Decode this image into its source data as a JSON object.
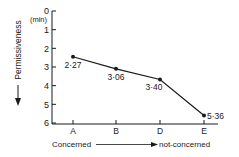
{
  "chart_data": {
    "type": "line",
    "title": "",
    "xlabel": "Concerned → not-concerned",
    "xlabel_left": "Concerned",
    "xlabel_right": "not-concerned",
    "ylabel": "Permissiveness",
    "y_unit": "(min)",
    "ylim": [
      0,
      6
    ],
    "y_inverted": true,
    "y_ticks": [
      "0",
      "1",
      "2",
      "3",
      "4",
      "5",
      "6"
    ],
    "categories": [
      "A",
      "B",
      "D",
      "E"
    ],
    "values": [
      2.45,
      3.1,
      3.667,
      5.6
    ],
    "point_labels": [
      "2·27",
      "3·06",
      "3·40",
      "5·36"
    ],
    "grid": false,
    "legend": null
  }
}
